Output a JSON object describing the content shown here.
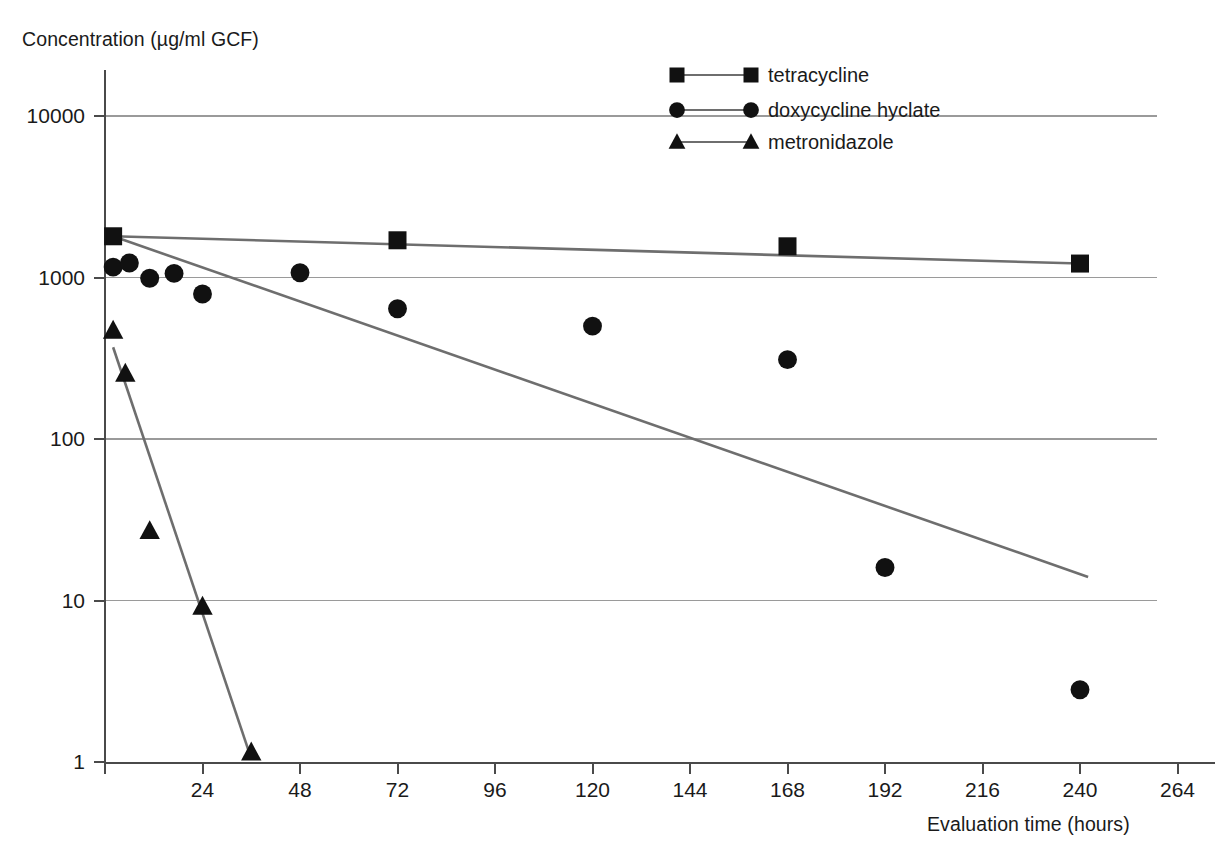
{
  "chart_data": {
    "type": "scatter",
    "title": "",
    "xlabel": "Evaluation time (hours)",
    "ylabel": "Concentration (µg/ml GCF)",
    "yscale": "log",
    "ylim": [
      1,
      20000
    ],
    "xlim": [
      0,
      288
    ],
    "yticks": [
      1,
      10,
      100,
      1000,
      10000
    ],
    "ytick_labels": [
      "1",
      "10",
      "100",
      "1000",
      "10000"
    ],
    "xticks": [
      0,
      24,
      48,
      72,
      96,
      120,
      144,
      168,
      192,
      216,
      240,
      264
    ],
    "xtick_labels": [
      "",
      "24",
      "48",
      "72",
      "96",
      "120",
      "144",
      "168",
      "192",
      "216",
      "240",
      "264"
    ],
    "grid": "horizontal",
    "legend_position": "top-right",
    "marker_color": "#111111",
    "line_color": "#6e6e6e",
    "grid_color": "#9a9a9a",
    "axis_color": "#4a4a4a",
    "series": [
      {
        "name": "tetracycline",
        "marker": "square",
        "points": [
          {
            "x": 2,
            "y": 1800
          },
          {
            "x": 72,
            "y": 1700
          },
          {
            "x": 168,
            "y": 1560
          },
          {
            "x": 240,
            "y": 1220
          }
        ],
        "trend": [
          {
            "x": 2,
            "y": 1800
          },
          {
            "x": 240,
            "y": 1220
          }
        ]
      },
      {
        "name": "doxycycline hyclate",
        "marker": "circle",
        "points": [
          {
            "x": 2,
            "y": 1160
          },
          {
            "x": 6,
            "y": 1230
          },
          {
            "x": 11,
            "y": 990
          },
          {
            "x": 17,
            "y": 1060
          },
          {
            "x": 24,
            "y": 790
          },
          {
            "x": 48,
            "y": 1070
          },
          {
            "x": 72,
            "y": 640
          },
          {
            "x": 120,
            "y": 500
          },
          {
            "x": 168,
            "y": 310
          },
          {
            "x": 192,
            "y": 16
          },
          {
            "x": 240,
            "y": 2.8
          }
        ],
        "trend": [
          {
            "x": 2,
            "y": 1800
          },
          {
            "x": 242,
            "y": 14
          }
        ]
      },
      {
        "name": "metronidazole",
        "marker": "triangle",
        "points": [
          {
            "x": 2,
            "y": 470
          },
          {
            "x": 5,
            "y": 255
          },
          {
            "x": 11,
            "y": 27
          },
          {
            "x": 24,
            "y": 9.2
          },
          {
            "x": 36,
            "y": 1.15
          }
        ],
        "trend": [
          {
            "x": 2,
            "y": 370
          },
          {
            "x": 36,
            "y": 1.05
          }
        ]
      }
    ]
  },
  "legend": {
    "items": [
      {
        "label": "tetracycline",
        "marker": "square"
      },
      {
        "label": "doxycycline hyclate",
        "marker": "circle"
      },
      {
        "label": "metronidazole",
        "marker": "triangle"
      }
    ]
  }
}
